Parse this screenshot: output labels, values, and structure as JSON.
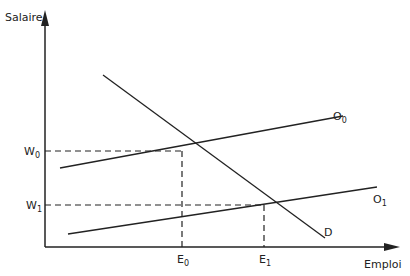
{
  "axes": {
    "y_label": "Salaire",
    "x_label": "Emploi"
  },
  "curves": {
    "demand": {
      "label": "D"
    },
    "supply0": {
      "label": "O",
      "sub": "0"
    },
    "supply1": {
      "label": "O",
      "sub": "1"
    }
  },
  "levels": {
    "w0": {
      "label": "W",
      "sub": "0"
    },
    "w1": {
      "label": "W",
      "sub": "1"
    },
    "e0": {
      "label": "E",
      "sub": "0"
    },
    "e1": {
      "label": "E",
      "sub": "1"
    }
  },
  "colors": {
    "line": "#222222",
    "background": "#ffffff"
  }
}
